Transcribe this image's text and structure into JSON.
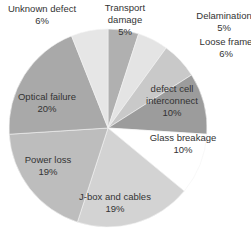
{
  "chart_data": {
    "type": "pie",
    "title": "",
    "start": "top",
    "direction": "clockwise",
    "slices": [
      {
        "label": "Transport damage",
        "value": 5,
        "display": "5%",
        "color": "#b0b0b0"
      },
      {
        "label": "Delamination",
        "value": 5,
        "display": "5%",
        "color": "#e4e4e4"
      },
      {
        "label": "Loose frame",
        "value": 6,
        "display": "6%",
        "color": "#c9c9c9"
      },
      {
        "label": "defect cell interconnect",
        "value": 10,
        "display": "10%",
        "color": "#9c9c9c"
      },
      {
        "label": "Glass breakage",
        "value": 10,
        "display": "10%",
        "color": "#ffffff"
      },
      {
        "label": "J-box and cables",
        "value": 19,
        "display": "19%",
        "color": "#d3d3d3"
      },
      {
        "label": "Power loss",
        "value": 19,
        "display": "19%",
        "color": "#bdbdbd"
      },
      {
        "label": "Optical failure",
        "value": 20,
        "display": "20%",
        "color": "#a9a9a9"
      },
      {
        "label": "Unknown defect",
        "value": 6,
        "display": "6%",
        "color": "#e6e6e6"
      }
    ]
  }
}
